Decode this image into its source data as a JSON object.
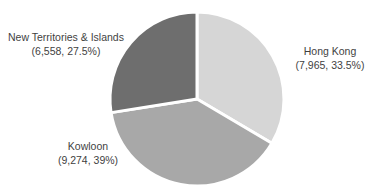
{
  "chart_data": {
    "type": "pie",
    "title": "",
    "subtitle": "",
    "xlabel": "",
    "ylabel": "",
    "grid": false,
    "legend_position": "none",
    "labels_position": "outside",
    "total": 23797,
    "start_angle_deg": 0,
    "direction": "clockwise",
    "categories": [
      "Hong Kong",
      "Kowloon",
      "New Territories & Islands"
    ],
    "values": [
      7965,
      9274,
      6558
    ],
    "percents": [
      33.5,
      39,
      27.5
    ],
    "colors": [
      "#d6d6d6",
      "#a8a8a8",
      "#6e6e6e"
    ],
    "slices": [
      {
        "name": "Hong Kong",
        "value": 7965,
        "value_text": "7,965",
        "percent": 33.5,
        "percent_text": "33.5%",
        "label_line1": "Hong Kong",
        "label_line2": "(7,965, 33.5%)",
        "color": "#d6d6d6",
        "start_deg": 0,
        "end_deg": 120.6
      },
      {
        "name": "Kowloon",
        "value": 9274,
        "value_text": "9,274",
        "percent": 39,
        "percent_text": "39%",
        "label_line1": "Kowloon",
        "label_line2": "(9,274, 39%)",
        "color": "#a8a8a8",
        "start_deg": 120.6,
        "end_deg": 261.0
      },
      {
        "name": "New Territories & Islands",
        "value": 6558,
        "value_text": "6,558",
        "percent": 27.5,
        "percent_text": "27.5%",
        "label_line1": "New Territories & Islands",
        "label_line2": "(6,558, 27.5%)",
        "color": "#6e6e6e",
        "start_deg": 261.0,
        "end_deg": 360.0
      }
    ]
  },
  "geometry": {
    "center_x": 197,
    "center_y": 99,
    "radius": 87,
    "separator_color": "#ffffff",
    "separator_width": 3
  },
  "background": "#ffffff",
  "text_color": "#3f3f3f"
}
